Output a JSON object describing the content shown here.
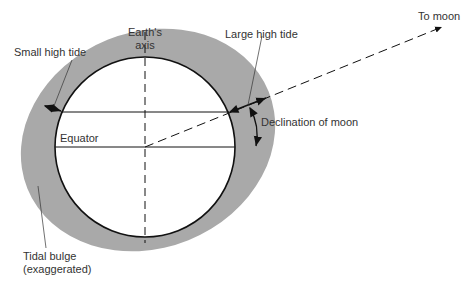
{
  "diagram": {
    "labels": {
      "earth_axis_line1": "Earth's",
      "earth_axis_line2": "axis",
      "small_high_tide": "Small high tide",
      "large_high_tide": "Large high tide",
      "to_moon": "To moon",
      "declination": "Declination of moon",
      "equator": "Equator",
      "tidal_bulge_line1": "Tidal bulge",
      "tidal_bulge_line2": "(exaggerated)"
    },
    "colors": {
      "bulge": "#a9a9a9",
      "earth_fill": "#ffffff",
      "stroke": "#111111",
      "text": "#333333"
    }
  }
}
